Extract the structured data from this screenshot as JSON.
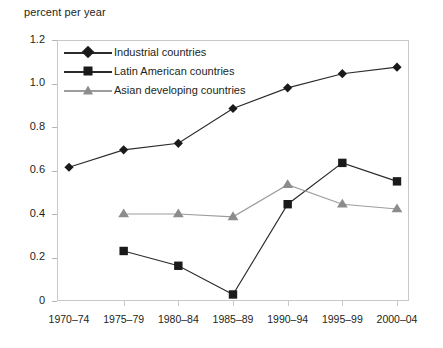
{
  "chart_data": {
    "type": "line",
    "title": "percent per year",
    "xlabel": "",
    "ylabel": "percent per year",
    "ylim": [
      0,
      1.2
    ],
    "ytick_values": [
      0,
      0.2,
      0.4,
      0.6,
      0.8,
      1.0,
      1.2
    ],
    "ytick_labels": [
      "0",
      "0.2",
      "0.4",
      "0.6",
      "0.8",
      "1.0",
      "1.2"
    ],
    "categories": [
      "1970–74",
      "1975–79",
      "1980–84",
      "1985–89",
      "1990–94",
      "1995–99",
      "2000–04"
    ],
    "grid": false,
    "legend_position": "inside top-left",
    "series": [
      {
        "name": "Industrial countries",
        "marker": "diamond",
        "color": "#1a1a1a",
        "line_color": "#2b2b2b",
        "values": [
          0.615,
          0.695,
          0.725,
          0.885,
          0.98,
          1.045,
          1.075
        ]
      },
      {
        "name": "Latin American countries",
        "marker": "square",
        "color": "#1a1a1a",
        "line_color": "#2b2b2b",
        "values": [
          null,
          0.23,
          0.162,
          0.03,
          0.445,
          0.635,
          0.55
        ]
      },
      {
        "name": "Asian developing countries",
        "marker": "triangle",
        "color": "#8c8c8c",
        "line_color": "#9d9d9d",
        "values": [
          null,
          0.4,
          0.4,
          0.387,
          0.535,
          0.445,
          0.423
        ]
      }
    ]
  },
  "legend": {
    "items": [
      {
        "label": "Industrial countries"
      },
      {
        "label": "Latin American countries"
      },
      {
        "label": "Asian developing countries"
      }
    ]
  },
  "axes": {
    "y_title": "percent per year",
    "frame_color": "#c9c9c9",
    "tick_color": "#b5b5b5"
  }
}
